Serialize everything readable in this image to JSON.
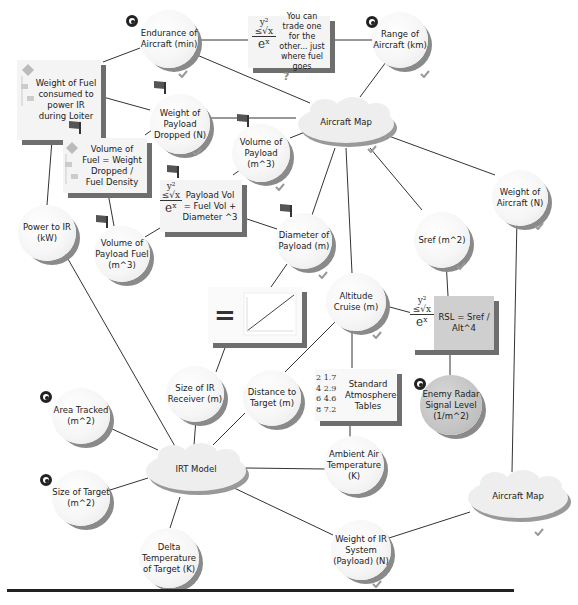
{
  "diagram": {
    "nodes": {
      "endurance": {
        "label": "Endurance of Aircraft (min)",
        "shape": "circle",
        "icons": [
          "target-icon",
          "check-icon"
        ]
      },
      "trade_note": {
        "label": "You can trade one for the other... just where fuel goes",
        "shape": "box",
        "icons": [
          "formula-icon",
          "question-icon"
        ]
      },
      "range": {
        "label": "Range of Aircraft (km)",
        "shape": "circle",
        "icons": [
          "target-icon",
          "check-icon"
        ]
      },
      "weight_fuel_loiter": {
        "label": "Weight of Fuel consumed to power IR during Loiter",
        "shape": "box",
        "icons": [
          "flowchart-icon"
        ]
      },
      "weight_payload_dropped": {
        "label": "Weight of Payload Dropped (N)",
        "shape": "circle",
        "icons": [
          "flag-icon",
          "check-icon"
        ]
      },
      "aircraft_map_top": {
        "label": "Aircraft Map",
        "shape": "cloud",
        "icons": [
          "check-icon"
        ]
      },
      "volume_fuel_eq": {
        "label": "Volume of Fuel = Weight Dropped / Fuel Density",
        "shape": "box",
        "icons": [
          "flag-icon",
          "flowchart-icon"
        ]
      },
      "volume_payload": {
        "label": "Volume of Payload (m^3)",
        "shape": "circle",
        "icons": [
          "flag-icon",
          "check-icon"
        ]
      },
      "payload_vol_eq": {
        "label": "Payload Vol = Fuel Vol + Diameter ^3",
        "shape": "box",
        "icons": [
          "flag-icon",
          "formula-icon"
        ]
      },
      "weight_aircraft": {
        "label": "Weight of Aircraft (N)",
        "shape": "circle",
        "icons": [
          "check-icon"
        ]
      },
      "power_ir": {
        "label": "Power to IR (kW)",
        "shape": "circle",
        "icons": []
      },
      "volume_payload_fuel": {
        "label": "Volume of Payload Fuel (m^3)",
        "shape": "circle",
        "icons": [
          "flag-icon"
        ]
      },
      "diameter_payload": {
        "label": "Diameter of Payload (m)",
        "shape": "circle",
        "icons": [
          "flag-icon",
          "check-icon"
        ]
      },
      "sref": {
        "label": "Sref (m^2)",
        "shape": "circle",
        "icons": [
          "check-icon"
        ]
      },
      "graph_box": {
        "label": "=",
        "shape": "box",
        "icons": [
          "line-graph-icon"
        ]
      },
      "altitude_cruise": {
        "label": "Altitude Cruise (m)",
        "shape": "circle",
        "icons": [
          "check-icon"
        ]
      },
      "rsl_eq": {
        "label": "RSL = Sref / Alt^4",
        "shape": "box",
        "icons": [
          "formula-icon"
        ]
      },
      "size_ir_receiver": {
        "label": "Size of IR Receiver (m)",
        "shape": "circle",
        "icons": []
      },
      "distance_target": {
        "label": "Distance to Target (m)",
        "shape": "circle",
        "icons": []
      },
      "std_atmosphere": {
        "label": "Standard Atmosphere Tables",
        "shape": "box",
        "icons": [
          "table-icon"
        ],
        "table": [
          [
            "2",
            "1.7"
          ],
          [
            "4",
            "2.9"
          ],
          [
            "6",
            "4.6"
          ],
          [
            "8",
            "7.2"
          ]
        ]
      },
      "enemy_radar": {
        "label": "Enemy Radar Signal Level (1/m^2)",
        "shape": "circle",
        "icons": [
          "target-icon"
        ]
      },
      "area_tracked": {
        "label": "Area Tracked (m^2)",
        "shape": "circle",
        "icons": [
          "target-icon"
        ]
      },
      "irt_model": {
        "label": "IRT Model",
        "shape": "cloud",
        "icons": []
      },
      "ambient_air_temp": {
        "label": "Ambient Air Temperature (K)",
        "shape": "circle",
        "icons": []
      },
      "size_target": {
        "label": "Size of Target (m^2)",
        "shape": "circle",
        "icons": [
          "target-icon"
        ]
      },
      "aircraft_map_bottom": {
        "label": "Aircraft Map",
        "shape": "cloud",
        "icons": [
          "check-icon"
        ]
      },
      "delta_temp": {
        "label": "Delta Temperature of Target (K)",
        "shape": "circle",
        "icons": []
      },
      "weight_ir_system": {
        "label": "Weight of IR System (Payload) (N)",
        "shape": "circle",
        "icons": [
          "check-icon"
        ]
      }
    },
    "formula_glyph": {
      "top": "y²",
      "mid": "≤√x",
      "bot": "eˣ"
    },
    "question_glyph": "?",
    "equals_glyph": "="
  }
}
